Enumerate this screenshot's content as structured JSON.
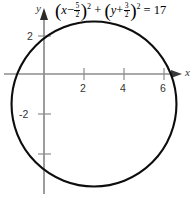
{
  "figure": {
    "background_color": "#ffffff",
    "curve_color": "#000000",
    "axis_color": "#8c8c8c",
    "label_color": "#333333",
    "equation": {
      "full_text": "(x - 5/2)^2 + (y + 3/2)^2 = 17",
      "lhs_var1": "x",
      "minus": "−",
      "frac1_num": "5",
      "frac1_den": "2",
      "exp1": "2",
      "plus_between": "+",
      "lhs_var2": "y",
      "plus_inner": "+",
      "frac2_num": "3",
      "frac2_den": "2",
      "exp2": "2",
      "equals": "=",
      "rhs": "17",
      "open_paren": "(",
      "close_paren": ")"
    },
    "axis_labels": {
      "x": "x",
      "y": "y"
    }
  },
  "chart_data": {
    "type": "line",
    "subtitle": "",
    "xlabel": "x",
    "ylabel": "y",
    "grid": false,
    "legend_position": "none",
    "shape": "circle",
    "center": [
      2.5,
      -1.5
    ],
    "radius": 4.1231,
    "radius_squared": 17,
    "xlim": [
      -1.5,
      7.6
    ],
    "ylim": [
      -6.2,
      3.6
    ],
    "x_ticks": [
      2,
      4,
      6
    ],
    "x_tick_labels": [
      "2",
      "4",
      "6"
    ],
    "y_ticks": [
      2,
      -2
    ],
    "y_tick_labels": [
      "2",
      "-2"
    ],
    "y_unlabeled_ticks": [
      -4
    ],
    "x_intercepts": [
      -0.339,
      5.339
    ],
    "y_intercepts": [],
    "series": [
      {
        "name": "circle",
        "equation": "(x - 2.5)^2 + (y + 1.5)^2 = 17",
        "color": "#000000",
        "linewidth": 2
      }
    ]
  },
  "geometry": {
    "origin_px": [
      44,
      74
    ],
    "unit_px": 20,
    "circle_center_px": [
      94,
      104
    ],
    "circle_radius_px": 82.5
  }
}
